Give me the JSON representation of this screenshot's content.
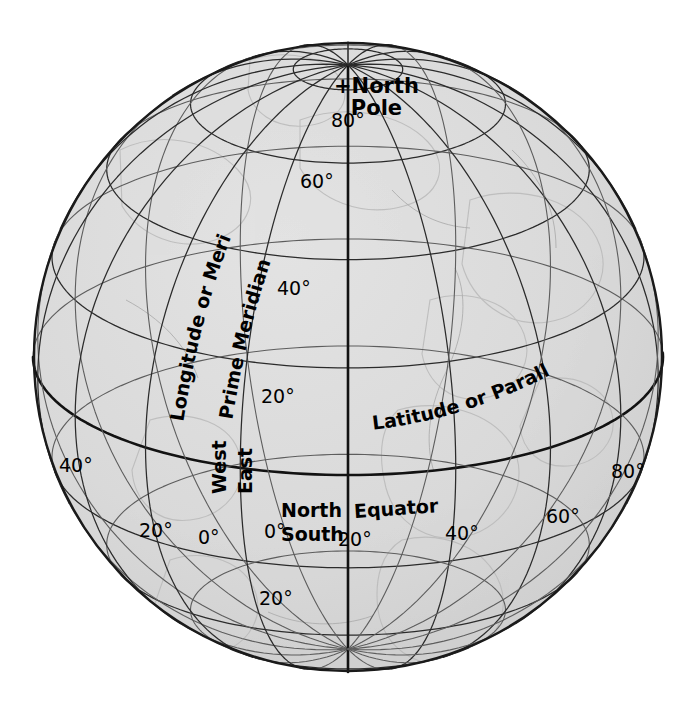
{
  "figure": {
    "type": "globe-graticule-diagram",
    "background_color": "#ffffff",
    "sphere_fill": "#d9d9d9",
    "line_color": "#2b2b2b",
    "major_line_color": "#121212"
  },
  "geometry": {
    "center_x": 348,
    "center_y": 357,
    "radius": 315,
    "tilt_degrees": 22,
    "graticule_step_degrees": 20,
    "projection": "orthographic"
  },
  "pole": {
    "label_line_1": "+North",
    "label_line_2": "Pole"
  },
  "named_labels": {
    "longitude": "Longitude or Meridian",
    "prime_meridian": "Prime Meridian",
    "latitude": "Latitude or Parallel",
    "equator": "Equator",
    "west": "West",
    "east": "East",
    "north": "North",
    "south": "South"
  },
  "latitude_labels": [
    {
      "text": "80°",
      "x": 331,
      "y": 110
    },
    {
      "text": "60°",
      "x": 300,
      "y": 171
    },
    {
      "text": "40°",
      "x": 277,
      "y": 278
    },
    {
      "text": "20°",
      "x": 261,
      "y": 386
    },
    {
      "text": "0°",
      "x": 264,
      "y": 521
    },
    {
      "text": "20°",
      "x": 259,
      "y": 588
    }
  ],
  "longitude_labels": [
    {
      "text": "40°",
      "x": 59,
      "y": 455,
      "hemisphere": "west"
    },
    {
      "text": "20°",
      "x": 139,
      "y": 520,
      "hemisphere": "west"
    },
    {
      "text": "0°",
      "x": 198,
      "y": 527,
      "hemisphere": "prime"
    },
    {
      "text": "20°",
      "x": 338,
      "y": 529,
      "hemisphere": "east"
    },
    {
      "text": "40°",
      "x": 445,
      "y": 523,
      "hemisphere": "east"
    },
    {
      "text": "60°",
      "x": 546,
      "y": 506,
      "hemisphere": "east"
    },
    {
      "text": "80°",
      "x": 611,
      "y": 461,
      "hemisphere": "east"
    }
  ],
  "chart_data": {
    "type": "diagram",
    "latitude_parallels_degrees": [
      80,
      60,
      40,
      20,
      0,
      -20,
      -40,
      -60
    ],
    "longitude_meridians_degrees": [
      -80,
      -60,
      -40,
      -20,
      0,
      20,
      40,
      60,
      80,
      100,
      120
    ],
    "spacing_degrees": 20,
    "highlighted_lines": [
      "Equator",
      "Prime Meridian"
    ],
    "annotations": [
      "+North Pole",
      "Longitude or Meridian",
      "Prime Meridian",
      "Latitude or Parallel",
      "Equator",
      "West",
      "East",
      "North",
      "South"
    ]
  }
}
